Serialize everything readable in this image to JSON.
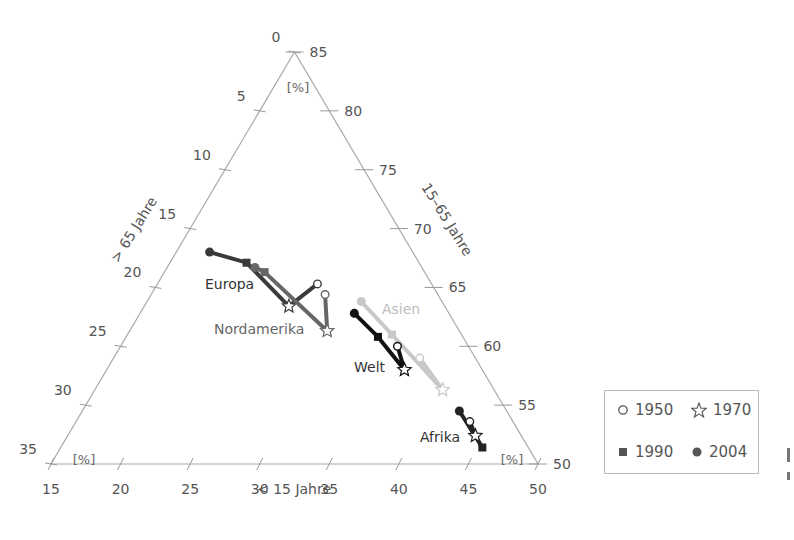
{
  "chart_data": {
    "type": "ternary",
    "title": "",
    "axes": {
      "bottom": {
        "label": "< 15 Jahre",
        "ticks": [
          15,
          20,
          25,
          30,
          35,
          40,
          45,
          50
        ],
        "range": [
          15,
          50
        ],
        "unit": "[%]"
      },
      "left": {
        "label": "> 65 Jahre",
        "ticks": [
          0,
          5,
          10,
          15,
          20,
          25,
          30,
          35
        ],
        "range": [
          0,
          35
        ],
        "unit": "[%]"
      },
      "right": {
        "label": "15–65 Jahre",
        "ticks": [
          85,
          80,
          75,
          70,
          65,
          60,
          55,
          50
        ],
        "range": [
          50,
          85
        ],
        "unit": "[%]"
      }
    },
    "legend": [
      {
        "year": "1950",
        "marker": "open-circle"
      },
      {
        "year": "1970",
        "marker": "open-star"
      },
      {
        "year": "1990",
        "marker": "filled-square"
      },
      {
        "year": "2004",
        "marker": "filled-circle"
      }
    ],
    "series": [
      {
        "name": "Europa",
        "color": "#3a3a3a",
        "label_pos": [
          205,
          289
        ],
        "points": [
          {
            "year": "1950",
            "under15": 26.5,
            "age15_65": 65.3,
            "over65": 8.2
          },
          {
            "year": "1970",
            "under15": 25.4,
            "age15_65": 63.4,
            "over65": 11.2
          },
          {
            "year": "1990",
            "under15": 20.5,
            "age15_65": 67.1,
            "over65": 12.4
          },
          {
            "year": "2004",
            "under15": 17.4,
            "age15_65": 68.0,
            "over65": 14.6
          }
        ]
      },
      {
        "name": "Nordamerika",
        "color": "#666666",
        "label_pos": [
          214,
          334
        ],
        "points": [
          {
            "year": "1950",
            "under15": 27.5,
            "age15_65": 64.4,
            "over65": 8.1
          },
          {
            "year": "1970",
            "under15": 29.2,
            "age15_65": 61.3,
            "over65": 9.5
          },
          {
            "year": "1990",
            "under15": 22.2,
            "age15_65": 66.3,
            "over65": 11.5
          },
          {
            "year": "2004",
            "under15": 21.3,
            "age15_65": 66.7,
            "over65": 12.0
          }
        ]
      },
      {
        "name": "Asien",
        "color": "#c8c8c8",
        "label_pos": [
          382,
          314
        ],
        "points": [
          {
            "year": "1950",
            "under15": 37.0,
            "age15_65": 59.0,
            "over65": 4.0
          },
          {
            "year": "1970",
            "under15": 40.0,
            "age15_65": 56.3,
            "over65": 3.7
          },
          {
            "year": "1990",
            "under15": 34.0,
            "age15_65": 61.0,
            "over65": 5.0
          },
          {
            "year": "2004",
            "under15": 30.4,
            "age15_65": 63.8,
            "over65": 5.8
          }
        ]
      },
      {
        "name": "Welt",
        "color": "#111111",
        "label_pos": [
          354,
          372
        ],
        "points": [
          {
            "year": "1950",
            "under15": 34.9,
            "age15_65": 60.0,
            "over65": 5.1
          },
          {
            "year": "1970",
            "under15": 36.4,
            "age15_65": 58.0,
            "over65": 5.6
          },
          {
            "year": "1990",
            "under15": 33.1,
            "age15_65": 60.8,
            "over65": 6.1
          },
          {
            "year": "2004",
            "under15": 30.4,
            "age15_65": 62.8,
            "over65": 6.8
          }
        ]
      },
      {
        "name": "Afrika",
        "color": "#222222",
        "label_pos": [
          420,
          442
        ],
        "points": [
          {
            "year": "1950",
            "under15": 43.3,
            "age15_65": 53.6,
            "over65": 3.1
          },
          {
            "year": "1970",
            "under15": 44.3,
            "age15_65": 52.4,
            "over65": 3.3
          },
          {
            "year": "1990",
            "under15": 45.3,
            "age15_65": 51.4,
            "over65": 3.3
          },
          {
            "year": "2004",
            "under15": 42.1,
            "age15_65": 54.5,
            "over65": 3.4
          }
        ]
      }
    ]
  },
  "legend": {
    "y1950": "1950",
    "y1970": "1970",
    "y1990": "1990",
    "y2004": "2004"
  }
}
